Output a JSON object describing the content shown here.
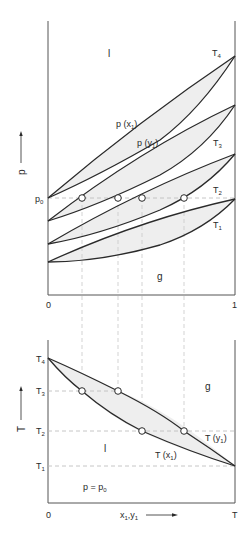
{
  "top_diagram": {
    "y_axis_label": "p",
    "x_tick_left": "0",
    "x_tick_right": "1",
    "p0_label": "p",
    "p0_sub": "0",
    "region_liquid": "l",
    "region_gas": "g",
    "curve_labels": {
      "px_main": "p (x",
      "px_sub": "1",
      "py_main": "p (y",
      "py_sub": "1"
    },
    "isotherms": [
      {
        "label": "T",
        "sub": "4"
      },
      {
        "label": "T",
        "sub": "3"
      },
      {
        "label": "T",
        "sub": "2"
      },
      {
        "label": "T",
        "sub": "1"
      }
    ]
  },
  "bottom_diagram": {
    "y_axis_label": "T",
    "x_tick_left": "0",
    "x_tick_right": "T",
    "x_axis_label_main": "x",
    "x_axis_label_sub1": "1",
    "x_axis_label_sep": ",y",
    "x_axis_label_sub2": "1",
    "region_liquid": "l",
    "region_gas": "g",
    "condition": "p = p",
    "condition_sub": "0",
    "curve_labels": {
      "ty_main": "T (y",
      "ty_sub": "1",
      "tx_main": "T (x",
      "tx_sub": "1"
    },
    "temperature_ticks": [
      {
        "label": "T",
        "sub": "4"
      },
      {
        "label": "T",
        "sub": "3"
      },
      {
        "label": "T",
        "sub": "2"
      },
      {
        "label": "T",
        "sub": "1"
      }
    ]
  },
  "colors": {
    "line": "#2a2a2a",
    "fill": "#eeeeee",
    "dash": "#b8b8b8"
  }
}
